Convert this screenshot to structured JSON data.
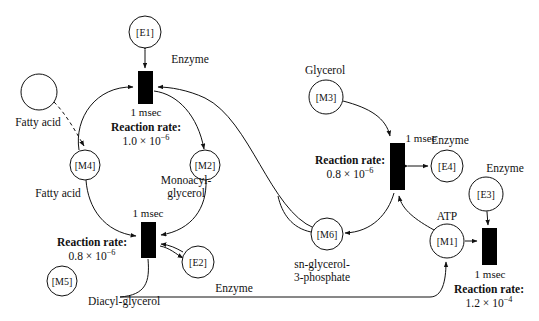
{
  "diagram": {
    "type": "petri-net",
    "stroke_color": "#111111",
    "fill_color": "#ffffff",
    "transition_color": "#000000"
  },
  "places": [
    {
      "id": "P-fattyacid-source",
      "token": "",
      "label": "Fatty acid",
      "cx": 39,
      "cy": 92,
      "r": 18,
      "label_x": 38,
      "label_y": 122
    },
    {
      "id": "M4",
      "token": "[M4]",
      "label": "Fatty acid",
      "cx": 85,
      "cy": 165,
      "r": 15,
      "label_x": 58,
      "label_y": 193
    },
    {
      "id": "M2",
      "token": "[M2]",
      "label": "Monoacyl-\nglycerol",
      "cx": 205,
      "cy": 165,
      "r": 15,
      "label_x": 186,
      "label_y": 186
    },
    {
      "id": "M5",
      "token": "[M5]",
      "label": "Diacyl-glycerol",
      "cx": 62,
      "cy": 281,
      "r": 15,
      "label_x": 125,
      "label_y": 301
    },
    {
      "id": "E1",
      "token": "[E1]",
      "label": "Enzyme",
      "cx": 145,
      "cy": 32,
      "r": 16,
      "label_x": 190,
      "label_y": 59
    },
    {
      "id": "E2",
      "token": "[E2]",
      "label": "Enzyme",
      "cx": 198,
      "cy": 262,
      "r": 16,
      "label_x": 232,
      "label_y": 288
    },
    {
      "id": "M3",
      "token": "[M3]",
      "label": "Glycerol",
      "cx": 326,
      "cy": 97,
      "r": 17,
      "label_x": 325,
      "label_y": 70
    },
    {
      "id": "M6",
      "token": "[M6]",
      "label": "sn-glycerol-\n3-phosphate",
      "cx": 327,
      "cy": 234,
      "r": 16,
      "label_x": 322,
      "label_y": 264
    },
    {
      "id": "E4",
      "token": "[E4]",
      "label": "Enzyme",
      "cx": 447,
      "cy": 166,
      "r": 16,
      "label_x": 448,
      "label_y": 140
    },
    {
      "id": "E3",
      "token": "[E3]",
      "label": "Enzyme",
      "cx": 486,
      "cy": 194,
      "r": 17,
      "label_x": 500,
      "label_y": 168
    },
    {
      "id": "M1",
      "token": "[M1]",
      "label": "ATP",
      "cx": 447,
      "cy": 241,
      "r": 17,
      "label_x": 447,
      "label_y": 216
    }
  ],
  "transitions": [
    {
      "id": "T1",
      "x": 138,
      "y": 71,
      "w": 15,
      "h": 33,
      "delay": "1 msec",
      "rate_label": "Reaction rate:",
      "rate_value_mantissa": "1.0 × 10",
      "rate_value_exponent": "−6",
      "text_x": 145,
      "text_y": 125
    },
    {
      "id": "T2",
      "x": 141,
      "y": 222,
      "w": 15,
      "h": 36,
      "delay": "1 msec",
      "rate_label": "Reaction rate:",
      "rate_value_mantissa": "0.8 × 10",
      "rate_value_exponent": "−6",
      "text_x": 91,
      "text_y": 250
    },
    {
      "id": "T3",
      "x": 390,
      "y": 143,
      "w": 15,
      "h": 47,
      "delay": "1 msec",
      "rate_label": "Reaction rate:",
      "rate_value_mantissa": "0.8 × 10",
      "rate_value_exponent": "−6",
      "text_x": 350,
      "text_y": 168
    },
    {
      "id": "T4",
      "x": 482,
      "y": 228,
      "w": 15,
      "h": 37,
      "delay": "1 msec",
      "rate_label": "Reaction rate:",
      "rate_value_mantissa": "1.2 × 10",
      "rate_value_exponent": "−4",
      "text_x": 490,
      "text_y": 287
    }
  ],
  "standalone_text": {
    "t1_msec": "1 msec",
    "t2_msec": "1 msec",
    "t3_msec": "1 msec",
    "t4_msec": "1 msec"
  },
  "labels": {
    "fatty_acid_source": "Fatty acid",
    "fatty_acid_m4": "Fatty acid",
    "monoacyl_line1": "Monoacyl-",
    "monoacyl_line2": "glycerol",
    "diacyl_glycerol": "Diacyl-glycerol",
    "glycerol": "Glycerol",
    "sn_glycerol_line1": "sn-glycerol-",
    "sn_glycerol_line2": "3-phosphate",
    "atp": "ATP",
    "enzyme_e1": "Enzyme",
    "enzyme_e2": "Enzyme",
    "enzyme_e4": "Enzyme",
    "enzyme_e3": "Enzyme",
    "reaction_rate": "Reaction rate:",
    "msec": "1 msec",
    "rate_t1": "1.0 × 10",
    "rate_t2": "0.8 × 10",
    "rate_t3": "0.8 × 10",
    "rate_t4": "1.2 × 10",
    "exp_minus6": "−6",
    "exp_minus4": "−4"
  },
  "tokens": {
    "e1": "[E1]",
    "e2": "[E2]",
    "e3": "[E3]",
    "e4": "[E4]",
    "m1": "[M1]",
    "m2": "[M2]",
    "m3": "[M3]",
    "m4": "[M4]",
    "m5": "[M5]",
    "m6": "[M6]"
  }
}
